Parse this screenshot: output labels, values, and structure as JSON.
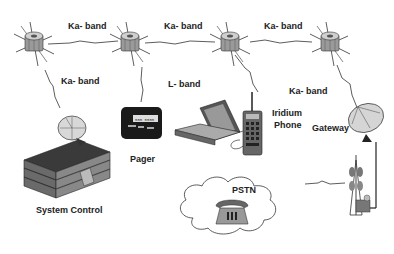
{
  "diagram": {
    "labels": {
      "ka_band_1": "Ka- band",
      "ka_band_2": "Ka- band",
      "ka_band_3": "Ka- band",
      "ka_band_down_left": "Ka- band",
      "l_band": "L- band",
      "ka_band_down_right": "Ka- band",
      "iridium_phone_line1": "Iridium",
      "iridium_phone_line2": "Phone",
      "pager": "Pager",
      "gateway": "Gateway",
      "system_control": "System Control",
      "pstn": "PSTN"
    },
    "nodes": [
      {
        "id": "sat1",
        "type": "satellite-icon"
      },
      {
        "id": "sat2",
        "type": "satellite-icon"
      },
      {
        "id": "sat3",
        "type": "satellite-icon"
      },
      {
        "id": "sat4",
        "type": "satellite-icon"
      },
      {
        "id": "system_control",
        "type": "building-icon"
      },
      {
        "id": "pager",
        "type": "pager-icon"
      },
      {
        "id": "laptop",
        "type": "laptop-icon"
      },
      {
        "id": "iridium_phone",
        "type": "satellite-phone-icon"
      },
      {
        "id": "gateway",
        "type": "dish-antenna-icon"
      },
      {
        "id": "tower",
        "type": "cell-tower-icon"
      },
      {
        "id": "pstn",
        "type": "cloud-icon"
      },
      {
        "id": "telephone",
        "type": "telephone-icon"
      }
    ],
    "colors": {
      "line": "#333333",
      "satellite_body": "#8a8a8a",
      "building": "#555555",
      "cloud_fill": "#ffffff"
    }
  }
}
